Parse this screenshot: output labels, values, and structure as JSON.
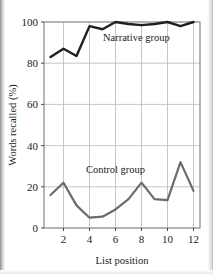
{
  "chart_data": {
    "type": "line",
    "title": "",
    "subtitle": "",
    "xlabel": "List position",
    "ylabel": "Words recalled (%)",
    "x": [
      1,
      2,
      3,
      4,
      5,
      6,
      7,
      8,
      9,
      10,
      11,
      12
    ],
    "xlim": [
      0.5,
      12.5
    ],
    "ylim": [
      0,
      100
    ],
    "xticks": [
      2,
      4,
      6,
      8,
      10,
      12
    ],
    "xtick_labels": [
      "2",
      "4",
      "6",
      "8",
      "10",
      "12"
    ],
    "yticks": [
      0,
      20,
      40,
      60,
      80,
      100
    ],
    "ytick_labels": [
      "0",
      "20",
      "40",
      "60",
      "80",
      "100"
    ],
    "grid": true,
    "grid_color": "#b9b9b9",
    "legend": "inline-annotations",
    "series": [
      {
        "name": "Narrative group",
        "color": "#1f1f1f",
        "values": [
          83,
          87,
          83.5,
          98,
          96.5,
          100,
          99,
          98.5,
          99,
          100,
          98,
          100
        ],
        "label": "Narrative group",
        "label_x": 7.6,
        "label_y": 91
      },
      {
        "name": "Control group",
        "color": "#6b6b6b",
        "values": [
          16,
          22,
          11,
          5,
          5.5,
          9,
          14,
          22,
          14,
          13.5,
          32,
          18
        ],
        "label": "Control group",
        "label_x": 6.0,
        "label_y": 26.5
      }
    ],
    "annotations": [
      {
        "text": "Narrative group",
        "series": "Narrative group"
      },
      {
        "text": "Control group",
        "series": "Control group"
      }
    ]
  }
}
